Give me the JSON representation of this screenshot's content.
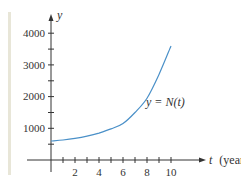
{
  "chart_data": {
    "type": "line",
    "title": "",
    "xlabel": "t (year)",
    "ylabel": "y",
    "xlim": [
      0,
      11
    ],
    "ylim": [
      0,
      4500
    ],
    "x_ticks": [
      1,
      2,
      3,
      4,
      5,
      6,
      7,
      8,
      9,
      10
    ],
    "x_tick_labels": [
      "2",
      "4",
      "6",
      "8",
      "10"
    ],
    "y_ticks": [
      500,
      1000,
      1500,
      2000,
      2500,
      3000,
      3500,
      4000
    ],
    "y_tick_labels": [
      "1000",
      "2000",
      "3000",
      "4000"
    ],
    "grid": false,
    "legend": "none",
    "series": [
      {
        "name": "y = N(t)",
        "color": "#4a90c8",
        "x": [
          0,
          1,
          2,
          3,
          4,
          5,
          6,
          7,
          8,
          9,
          10
        ],
        "values": [
          600,
          630,
          680,
          750,
          850,
          980,
          1150,
          1500,
          1950,
          2700,
          3600
        ]
      }
    ],
    "annotations": [
      {
        "text": "y = N(t)",
        "x": 8.5,
        "y": 1700
      }
    ]
  },
  "labels": {
    "y_axis": "y",
    "t_axis_var": "t",
    "t_axis_unit": "(year)",
    "curve": "y = N(t)",
    "y_tick_1000": "1000",
    "y_tick_2000": "2000",
    "y_tick_3000": "3000",
    "y_tick_4000": "4000",
    "x_tick_2": "2",
    "x_tick_4": "4",
    "x_tick_6": "6",
    "x_tick_8": "8",
    "x_tick_10": "10"
  },
  "colors": {
    "curve": "#4a90c8",
    "axis": "#333333",
    "side_bar": "#e8e6d8"
  }
}
